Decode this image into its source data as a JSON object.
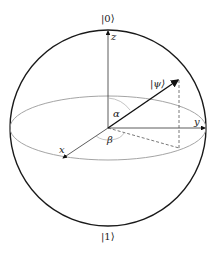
{
  "diagram": {
    "labels": {
      "ket0": "|0⟩",
      "ket1": "|1⟩",
      "psi": "|ψ⟩",
      "z": "z",
      "y": "y",
      "x": "x",
      "alpha": "α",
      "beta": "β"
    },
    "colors": {
      "sphere": "#1a1a1a",
      "equator": "#9a9a9a",
      "axes": "#333333",
      "vector": "#111111",
      "dashed": "#555555"
    }
  }
}
